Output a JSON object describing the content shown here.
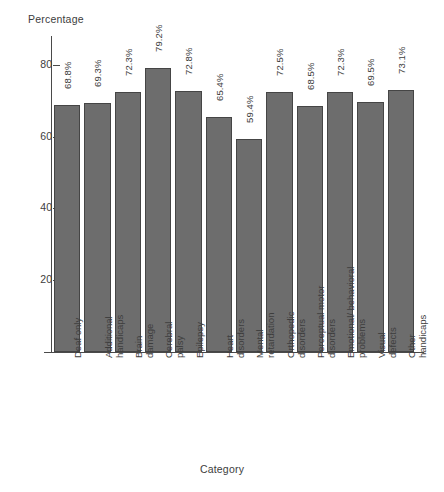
{
  "chart_data": {
    "type": "bar",
    "title": "",
    "xlabel": "Category",
    "ylabel": "Percentage",
    "ylim": [
      0,
      88
    ],
    "yticks": [
      20,
      40,
      60,
      80
    ],
    "ytick_labels": [
      "20",
      "40",
      "60",
      "80"
    ],
    "grid": false,
    "legend": "none",
    "orientation": "vertical",
    "bar_color": "#6d6d6d",
    "bar_edge_color": "#454545",
    "categories": [
      "Deaf only",
      "Additional handicaps",
      "Brain damage",
      "Cerebral palsy",
      "Epilepsy",
      "Heart disorders",
      "Mental retardation",
      "Orthopedic disorders",
      "Perceptual motor disorders",
      "Emotional/ behavioral problems",
      "Visual defects",
      "Other handicaps"
    ],
    "category_lines": [
      [
        "Deaf only",
        ""
      ],
      [
        "Additional",
        "handicaps"
      ],
      [
        "Brain",
        "damage"
      ],
      [
        "Cerebral",
        "palsy"
      ],
      [
        "Epilepsy",
        ""
      ],
      [
        "Heart",
        "disorders"
      ],
      [
        "Mental",
        "retardation"
      ],
      [
        "Orthopedic",
        "disorders"
      ],
      [
        "Perceptual motor",
        "disorders"
      ],
      [
        "Emotional/ behavioral",
        "problems"
      ],
      [
        "Visual",
        "defects"
      ],
      [
        "Other",
        "handicaps"
      ]
    ],
    "values": [
      68.8,
      69.3,
      72.3,
      79.2,
      72.8,
      65.4,
      59.4,
      72.5,
      68.5,
      72.3,
      69.5,
      73.1
    ],
    "value_labels": [
      "68.8%",
      "69.3%",
      "72.3%",
      "79.2%",
      "72.8%",
      "65.4%",
      "59.4%",
      "72.5%",
      "68.5%",
      "72.3%",
      "69.5%",
      "73.1%"
    ]
  }
}
